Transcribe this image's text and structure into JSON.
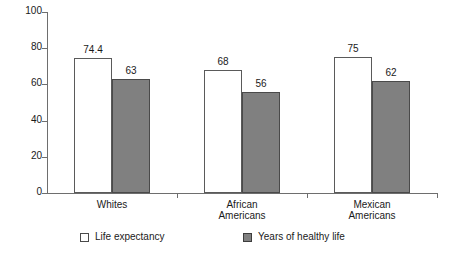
{
  "chart_data": {
    "type": "bar",
    "title": "",
    "subtitle": "",
    "xlabel": "",
    "ylabel": "",
    "ylim": [
      0,
      100
    ],
    "yticks": [
      0,
      20,
      40,
      60,
      80,
      100
    ],
    "grid": false,
    "legend_position": "bottom",
    "categories": [
      "Whites",
      "African\nAmericans",
      "Mexican\nAmericans"
    ],
    "series": [
      {
        "name": "Life expectancy",
        "color": "#ffffff",
        "values": [
          74.4,
          68,
          75
        ],
        "labels": [
          "74.4",
          "68",
          "75"
        ]
      },
      {
        "name": "Years of healthy life",
        "color": "#808080",
        "values": [
          63,
          56,
          62
        ],
        "labels": [
          "63",
          "56",
          "62"
        ]
      }
    ]
  },
  "axis": {
    "y_tick_labels": [
      "0",
      "20",
      "40",
      "60",
      "80",
      "100"
    ]
  },
  "legend": {
    "entries": [
      {
        "label": "Life expectancy",
        "swatch": "white-square-swatch"
      },
      {
        "label": "Years of healthy life",
        "swatch": "gray-square-swatch"
      }
    ]
  }
}
